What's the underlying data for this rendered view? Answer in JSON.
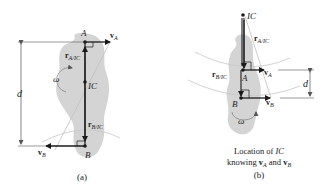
{
  "figure_a": {
    "point_A": "A",
    "point_B": "B",
    "point_IC": "IC",
    "velocity_A": {
      "main": "v",
      "sub": "A"
    },
    "velocity_B": {
      "main": "v",
      "sub": "B"
    },
    "position_A": {
      "main": "r",
      "sub": "A/IC"
    },
    "position_B": {
      "main": "r",
      "sub": "B/IC"
    },
    "omega": "ω",
    "distance": "d",
    "caption": "(a)"
  },
  "figure_b": {
    "point_A": "A",
    "point_B": "B",
    "point_IC": "IC",
    "velocity_A": {
      "main": "v",
      "sub": "A"
    },
    "velocity_B": {
      "main": "v",
      "sub": "B"
    },
    "position_A": {
      "main": "r",
      "sub": "A/IC"
    },
    "position_B": {
      "main": "r",
      "sub": "B/IC"
    },
    "omega": "ω",
    "distance": "d",
    "caption_line1_pre": "Location of ",
    "caption_line1_it": "IC",
    "caption_line2_pre": "knowing ",
    "caption_line2_v1": "v",
    "caption_line2_s1": "A",
    "caption_line2_mid": " and ",
    "caption_line2_v2": "v",
    "caption_line2_s2": "B",
    "caption": "(b)"
  },
  "colors": {
    "body_fill": "#d4d4d4",
    "line": "#1a1a1a",
    "guide": "#bdbdbd"
  }
}
